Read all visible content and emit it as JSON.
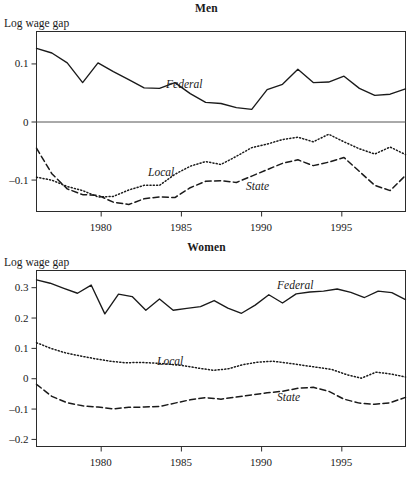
{
  "figure": {
    "panels": [
      {
        "id": "men",
        "title": "Men",
        "ylabel": "Log wage gap",
        "series_labels": {
          "federal": "Federal",
          "local": "Local",
          "state": "State"
        }
      },
      {
        "id": "women",
        "title": "Women",
        "ylabel": "Log wage gap",
        "series_labels": {
          "federal": "Federal",
          "local": "Local",
          "state": "State"
        }
      }
    ]
  },
  "chart_data": [
    {
      "type": "line",
      "title": "Men",
      "xlabel": "",
      "ylabel": "Log wage gap",
      "xlim": [
        1976,
        1999
      ],
      "ylim": [
        -0.155,
        0.155
      ],
      "xticks": [
        1980,
        1985,
        1990,
        1995
      ],
      "xtick_labels": [
        "1980",
        "1985",
        "1990",
        "1995"
      ],
      "yticks": [
        0.1,
        0,
        -0.1
      ],
      "ytick_labels": [
        "0.1",
        "0",
        "-0.1"
      ],
      "grid": false,
      "zero_line": true,
      "legend": "inline-annotations",
      "x": [
        1976,
        1977,
        1978,
        1979,
        1980,
        1981,
        1982,
        1983,
        1984,
        1985,
        1986,
        1987,
        1988,
        1989,
        1990,
        1991,
        1992,
        1993,
        1994,
        1995,
        1996,
        1997,
        1998,
        1999
      ],
      "series": [
        {
          "name": "Federal",
          "style": "solid",
          "values": [
            0.126,
            0.118,
            0.101,
            0.067,
            0.101,
            0.086,
            0.072,
            0.058,
            0.057,
            0.067,
            0.048,
            0.033,
            0.031,
            0.024,
            0.021,
            0.055,
            0.064,
            0.09,
            0.067,
            0.068,
            0.078,
            0.057,
            0.045,
            0.047,
            0.056
          ]
        },
        {
          "name": "Local",
          "style": "dotted",
          "values": [
            -0.096,
            -0.101,
            -0.112,
            -0.119,
            -0.13,
            -0.129,
            -0.118,
            -0.11,
            -0.11,
            -0.091,
            -0.077,
            -0.069,
            -0.074,
            -0.06,
            -0.045,
            -0.039,
            -0.031,
            -0.027,
            -0.035,
            -0.022,
            -0.035,
            -0.047,
            -0.056,
            -0.044,
            -0.057
          ]
        },
        {
          "name": "State",
          "style": "dashed",
          "values": [
            -0.046,
            -0.09,
            -0.116,
            -0.126,
            -0.127,
            -0.139,
            -0.143,
            -0.133,
            -0.13,
            -0.131,
            -0.114,
            -0.103,
            -0.102,
            -0.105,
            -0.094,
            -0.083,
            -0.072,
            -0.066,
            -0.076,
            -0.07,
            -0.062,
            -0.086,
            -0.11,
            -0.119,
            -0.093
          ]
        }
      ]
    },
    {
      "type": "line",
      "title": "Women",
      "xlabel": "",
      "ylabel": "Log wage gap",
      "xlim": [
        1976,
        1999
      ],
      "ylim": [
        -0.225,
        0.355
      ],
      "xticks": [
        1980,
        1985,
        1990,
        1995
      ],
      "xtick_labels": [
        "1980",
        "1985",
        "1990",
        "1995"
      ],
      "yticks": [
        0.3,
        0.2,
        0.1,
        0,
        -0.1,
        -0.2
      ],
      "ytick_labels": [
        "0.3",
        "0.2",
        "0.1",
        "0",
        "-0.1",
        "-0.2"
      ],
      "grid": false,
      "zero_line": false,
      "legend": "inline-annotations",
      "x": [
        1976,
        1977,
        1978,
        1979,
        1980,
        1981,
        1982,
        1983,
        1984,
        1985,
        1986,
        1987,
        1988,
        1989,
        1990,
        1991,
        1992,
        1993,
        1994,
        1995,
        1996,
        1997,
        1998,
        1999
      ],
      "series": [
        {
          "name": "Federal",
          "style": "solid",
          "values": [
            0.324,
            0.313,
            0.296,
            0.28,
            0.307,
            0.212,
            0.277,
            0.269,
            0.224,
            0.261,
            0.224,
            0.23,
            0.236,
            0.256,
            0.231,
            0.214,
            0.241,
            0.275,
            0.248,
            0.278,
            0.284,
            0.287,
            0.294,
            0.283,
            0.266,
            0.287,
            0.282,
            0.259
          ]
        },
        {
          "name": "Local",
          "style": "dotted",
          "values": [
            0.117,
            0.098,
            0.083,
            0.073,
            0.064,
            0.056,
            0.051,
            0.052,
            0.05,
            0.046,
            0.041,
            0.033,
            0.026,
            0.031,
            0.045,
            0.053,
            0.056,
            0.05,
            0.043,
            0.036,
            0.029,
            0.012,
            0.0,
            0.02,
            0.014,
            0.004
          ]
        },
        {
          "name": "State",
          "style": "dashed",
          "values": [
            -0.02,
            -0.06,
            -0.081,
            -0.091,
            -0.095,
            -0.101,
            -0.096,
            -0.095,
            -0.093,
            -0.082,
            -0.071,
            -0.064,
            -0.069,
            -0.062,
            -0.055,
            -0.048,
            -0.043,
            -0.033,
            -0.03,
            -0.043,
            -0.069,
            -0.082,
            -0.086,
            -0.081,
            -0.063
          ]
        }
      ]
    }
  ]
}
